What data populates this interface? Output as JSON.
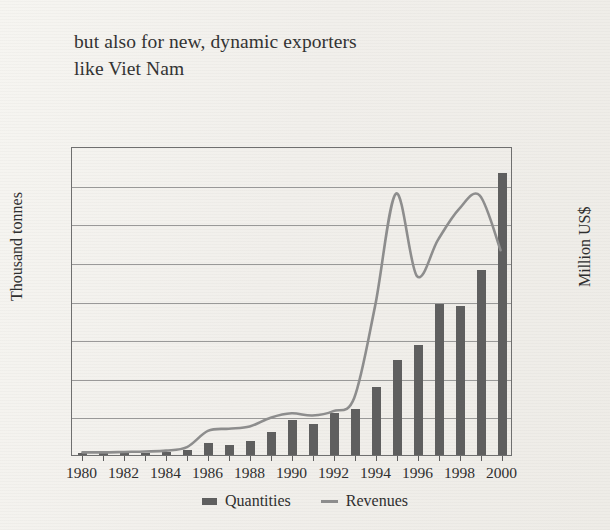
{
  "caption": {
    "line1": "but also for new, dynamic exporters",
    "line2": "like Viet Nam"
  },
  "legend": {
    "quantities": "Quantities",
    "revenues": "Revenues"
  },
  "colors": {
    "bar": "#5f5f5f",
    "line": "#8d8d8d",
    "axis": "#6f6f6f",
    "grid": "#8a8a8a",
    "background": "#f2f0ec",
    "text": "#2f2f2f"
  },
  "chart_data": {
    "type": "bar",
    "title": "but also for new, dynamic exporters like Viet Nam",
    "xlabel": "",
    "ylabel": "Thousand tonnes",
    "y2label": "Million US$",
    "ylim": [
      0,
      800
    ],
    "y2lim": [
      0,
      700
    ],
    "yticks": [
      0,
      100,
      200,
      300,
      400,
      500,
      600,
      700,
      800
    ],
    "y2ticks": [
      0,
      100,
      200,
      300,
      400,
      500,
      600,
      700
    ],
    "grid": true,
    "legend_position": "bottom",
    "categories": [
      1980,
      1981,
      1982,
      1983,
      1984,
      1985,
      1986,
      1987,
      1988,
      1989,
      1990,
      1991,
      1992,
      1993,
      1994,
      1995,
      1996,
      1997,
      1998,
      1999,
      2000
    ],
    "xtick_labels": [
      "1980",
      "1982",
      "1984",
      "1986",
      "1988",
      "1990",
      "1992",
      "1994",
      "1996",
      "1998",
      "2000"
    ],
    "series": [
      {
        "name": "Quantities",
        "unit": "Thousand tonnes",
        "axis": "left",
        "kind": "bar",
        "values": [
          4,
          4,
          5,
          6,
          8,
          12,
          30,
          25,
          35,
          60,
          90,
          80,
          110,
          120,
          175,
          245,
          285,
          390,
          385,
          480,
          730
        ]
      },
      {
        "name": "Revenues",
        "unit": "Million US$",
        "axis": "right",
        "kind": "line",
        "values": [
          6,
          6,
          7,
          8,
          10,
          18,
          55,
          60,
          65,
          85,
          95,
          90,
          100,
          130,
          340,
          596,
          408,
          490,
          560,
          592,
          467
        ]
      }
    ]
  }
}
